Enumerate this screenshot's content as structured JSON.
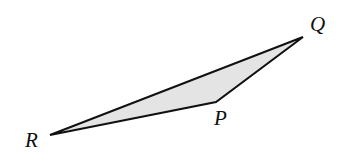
{
  "diagram": {
    "type": "triangle",
    "fill_color": "#e4e4e4",
    "stroke_color": "#111111",
    "vertices": [
      {
        "name": "Q",
        "x": 303,
        "y": 37,
        "label_x": 310,
        "label_y": 31
      },
      {
        "name": "P",
        "x": 216,
        "y": 102,
        "label_x": 214,
        "label_y": 125
      },
      {
        "name": "R",
        "x": 50,
        "y": 135,
        "label_x": 25,
        "label_y": 147
      }
    ],
    "labels": {
      "q": "Q",
      "p": "P",
      "r": "R"
    }
  }
}
